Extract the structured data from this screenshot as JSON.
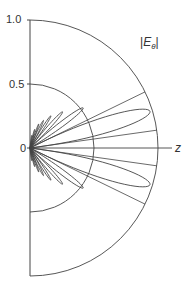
{
  "chart_data": {
    "type": "polar",
    "title": "",
    "legend_label": "|E_θ|",
    "axis_label": "z",
    "radial_ticks": [
      "0",
      "0.5",
      "1.0"
    ],
    "rlim": [
      0,
      1.0
    ],
    "theta_range_deg": [
      -90,
      90
    ],
    "grid": {
      "arcs": [
        0.5,
        1.0
      ]
    },
    "lobes": [
      {
        "angle_deg": 17,
        "magnitude": 0.98,
        "width_deg": 10
      },
      {
        "angle_deg": -17,
        "magnitude": 0.98,
        "width_deg": 10
      },
      {
        "angle_deg": 37,
        "magnitude": 0.52,
        "width_deg": 6
      },
      {
        "angle_deg": -37,
        "magnitude": 0.52,
        "width_deg": 6
      },
      {
        "angle_deg": 48,
        "magnitude": 0.38,
        "width_deg": 5
      },
      {
        "angle_deg": -48,
        "magnitude": 0.38,
        "width_deg": 5
      },
      {
        "angle_deg": 57,
        "magnitude": 0.3,
        "width_deg": 4
      },
      {
        "angle_deg": -57,
        "magnitude": 0.3,
        "width_deg": 4
      },
      {
        "angle_deg": 64,
        "magnitude": 0.24,
        "width_deg": 4
      },
      {
        "angle_deg": -64,
        "magnitude": 0.24,
        "width_deg": 4
      },
      {
        "angle_deg": 70,
        "magnitude": 0.2,
        "width_deg": 3
      },
      {
        "angle_deg": -70,
        "magnitude": 0.2,
        "width_deg": 3
      },
      {
        "angle_deg": 76,
        "magnitude": 0.15,
        "width_deg": 3
      },
      {
        "angle_deg": -76,
        "magnitude": 0.15,
        "width_deg": 3
      },
      {
        "angle_deg": 82,
        "magnitude": 0.1,
        "width_deg": 3
      },
      {
        "angle_deg": -82,
        "magnitude": 0.1,
        "width_deg": 3
      }
    ],
    "radial_lines_deg": [
      8,
      -8,
      26,
      -26
    ]
  },
  "labels": {
    "tick_1": "1.0",
    "tick_05": "0.5",
    "tick_0": "0",
    "z": "z",
    "legend_abs": "|",
    "legend_E": "E",
    "legend_sub": "θ",
    "legend_abs_close": "|"
  }
}
